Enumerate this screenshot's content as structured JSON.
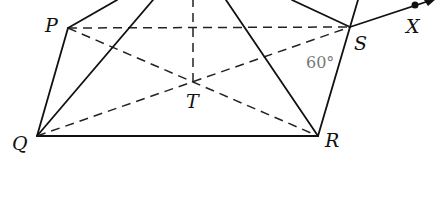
{
  "diagram": {
    "type": "geometry-pyramid",
    "points": {
      "P": {
        "label": "P",
        "x": 68,
        "y": 28
      },
      "Q": {
        "label": "Q",
        "x": 37,
        "y": 136
      },
      "R": {
        "label": "R",
        "x": 318,
        "y": 136
      },
      "S": {
        "label": "S",
        "x": 350,
        "y": 27
      },
      "T": {
        "label": "T",
        "x": 193,
        "y": 82
      },
      "X": {
        "label": "X",
        "x": 415,
        "y": 5
      }
    },
    "angle_label": "60°",
    "labels": {
      "P": "P",
      "Q": "Q",
      "R": "R",
      "S": "S",
      "T": "T",
      "X": "X"
    }
  }
}
